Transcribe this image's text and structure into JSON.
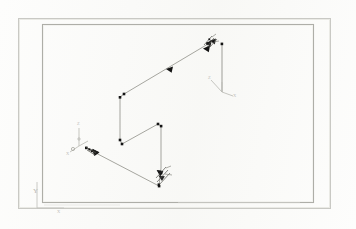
{
  "document": {
    "kind": "scanned-technical-drawing",
    "title": "",
    "background_color": "#fdfdfc",
    "ink_color": "#8e8e88",
    "marker_color": "#1b1b1b"
  },
  "borders": {
    "outer": {
      "x": 18,
      "y": 18,
      "width": 312,
      "height": 190,
      "stroke": "#c9c9c4",
      "stroke_width": 1
    },
    "inner": {
      "x": 42,
      "y": 24,
      "width": 271,
      "height": 178,
      "stroke": "#b0b0aa",
      "stroke_width": 1.1
    }
  },
  "labels": {
    "world_axis_y": "Y",
    "world_axis_x": "X",
    "triad_right_z": "Z",
    "triad_right_x": "X",
    "triad_left_z": "Z",
    "triad_left_x": "X"
  },
  "geometry": {
    "polyline_comment": "isometric routed path, vertex order as drawn",
    "path_points": [
      {
        "x": 208,
        "y": 44,
        "marker": "square"
      },
      {
        "x": 124,
        "y": 94,
        "marker": "square"
      },
      {
        "x": 120,
        "y": 97,
        "marker": "square"
      },
      {
        "x": 120,
        "y": 140,
        "marker": "square"
      },
      {
        "x": 122,
        "y": 144,
        "marker": "square"
      },
      {
        "x": 158,
        "y": 124,
        "marker": "square"
      },
      {
        "x": 161,
        "y": 126,
        "marker": "square"
      },
      {
        "x": 161,
        "y": 168,
        "marker": "square"
      },
      {
        "x": 159,
        "y": 186,
        "marker": "square"
      },
      {
        "x": 92,
        "y": 151,
        "marker": "square"
      },
      {
        "x": 86,
        "y": 148,
        "marker": "square"
      }
    ],
    "stub_right": {
      "x1": 222,
      "y1": 44,
      "x2": 222,
      "y2": 92
    },
    "arrow_heads": [
      {
        "x": 166,
        "y": 69,
        "angle": 211,
        "size": 6
      },
      {
        "x": 205,
        "y": 48,
        "angle": 211,
        "size": 6
      },
      {
        "x": 99,
        "y": 152,
        "angle": 208,
        "size": 6
      },
      {
        "x": 160,
        "y": 176,
        "angle": 250,
        "size": 6
      }
    ],
    "triads": [
      {
        "name": "triad-right",
        "origin_x": 222,
        "origin_y": 92,
        "arm": 13
      },
      {
        "name": "triad-left",
        "origin_x": 79,
        "origin_y": 146,
        "arm": 11
      }
    ],
    "world_axis": {
      "origin_x": 37,
      "origin_y": 208,
      "vertical_to_y": 182,
      "horizontal_to_x": 62
    }
  },
  "clusters": [
    {
      "name": "node-cluster-top-right",
      "cx": 210,
      "cy": 43
    },
    {
      "name": "node-cluster-bottom-center",
      "cx": 163,
      "cy": 178
    },
    {
      "name": "node-cluster-left",
      "cx": 90,
      "cy": 150
    }
  ]
}
